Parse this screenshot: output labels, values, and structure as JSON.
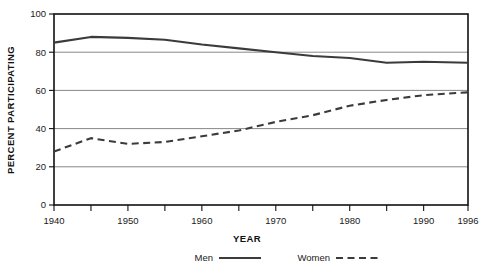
{
  "chart_data": {
    "type": "line",
    "title": "",
    "xlabel": "YEAR",
    "ylabel": "PERCENT PARTICIPATING",
    "xlim": [
      1940,
      1996
    ],
    "ylim": [
      0,
      100
    ],
    "grid": true,
    "legend_position": "bottom",
    "x_tick_labels": [
      "1940",
      "1950",
      "1960",
      "1970",
      "1980",
      "1990",
      "1996"
    ],
    "x_tick_values": [
      1940,
      1950,
      1960,
      1970,
      1980,
      1990,
      1996
    ],
    "x_minor_tick_values": [
      1945,
      1955,
      1965,
      1975,
      1985
    ],
    "y_tick_labels": [
      "0",
      "20",
      "40",
      "60",
      "80",
      "100"
    ],
    "y_tick_values": [
      0,
      20,
      40,
      60,
      80,
      100
    ],
    "x": [
      1940,
      1945,
      1950,
      1955,
      1960,
      1965,
      1970,
      1975,
      1980,
      1985,
      1990,
      1996
    ],
    "series": [
      {
        "name": "Men",
        "style": "solid",
        "color": "#3b3b3b",
        "values": [
          85,
          88,
          87.5,
          86.5,
          84,
          82,
          80,
          78,
          77,
          74.5,
          75,
          74.5
        ]
      },
      {
        "name": "Women",
        "style": "dashed",
        "color": "#3b3b3b",
        "values": [
          28,
          35,
          32,
          33,
          36,
          39,
          43.5,
          47,
          52,
          55,
          57.5,
          59
        ]
      }
    ]
  },
  "legend": {
    "items": [
      {
        "label": "Men",
        "style": "solid"
      },
      {
        "label": "Women",
        "style": "dashed"
      }
    ]
  },
  "colors": {
    "line": "#3b3b3b",
    "frame": "#111111",
    "gridline": "#7a7a7a",
    "background": "#ffffff"
  }
}
